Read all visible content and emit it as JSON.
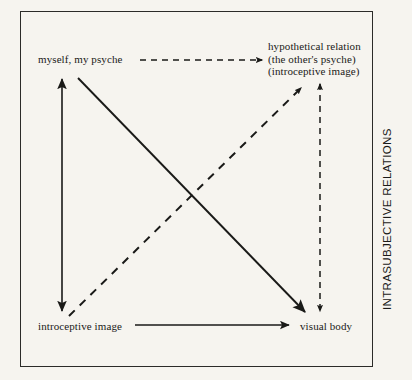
{
  "figure": {
    "background_color": "#f6f4ef",
    "ink_color": "#1a1a18",
    "frame_color": "#2b2b28"
  },
  "side_caption": {
    "text": "INTRASUBJECTIVE RELATIONS",
    "orientation": "vertical-bottom-to-top"
  },
  "nodes": {
    "myself": {
      "lines": [
        "myself, my psyche"
      ]
    },
    "hypothetical": {
      "lines": [
        "hypothetical relation",
        "(the other's psyche)",
        "(introceptive image)"
      ]
    },
    "introceptive": {
      "lines": [
        "introceptive image"
      ]
    },
    "visual_body": {
      "lines": [
        "visual body"
      ]
    }
  },
  "edges": [
    {
      "id": "top-horizontal",
      "from": "myself, my psyche",
      "to": "hypothetical relation",
      "style": "dashed",
      "arrowheads": "end"
    },
    {
      "id": "left-vertical",
      "from": "myself, my psyche",
      "to": "introceptive image",
      "style": "solid",
      "arrowheads": "both"
    },
    {
      "id": "right-vertical",
      "from": "hypothetical relation",
      "to": "visual body",
      "style": "dashed",
      "arrowheads": "both"
    },
    {
      "id": "bottom-horizontal",
      "from": "introceptive image",
      "to": "visual body",
      "style": "solid",
      "arrowheads": "end"
    },
    {
      "id": "diagonal-descending",
      "from": "myself, my psyche",
      "to": "visual body",
      "style": "solid",
      "arrowheads": "end"
    },
    {
      "id": "diagonal-ascending",
      "from": "introceptive image",
      "to": "hypothetical relation",
      "style": "dashed",
      "arrowheads": "end"
    }
  ]
}
